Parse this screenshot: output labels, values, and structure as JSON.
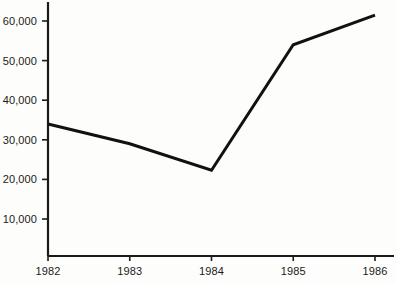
{
  "chart_data": {
    "type": "line",
    "title": "",
    "subtitle": "",
    "xlabel": "",
    "ylabel": "",
    "categories": [
      "1982",
      "1983",
      "1984",
      "1985",
      "1986"
    ],
    "x": [
      1982,
      1983,
      1984,
      1985,
      1986
    ],
    "values": [
      34000,
      29000,
      22300,
      54000,
      61500
    ],
    "series": [
      {
        "name": "",
        "values": [
          34000,
          29000,
          22300,
          54000,
          61500
        ]
      }
    ],
    "xlim": [
      1982,
      1986
    ],
    "ylim": [
      0,
      63500
    ],
    "yticks": [
      10000,
      20000,
      30000,
      40000,
      50000,
      60000
    ],
    "ytick_labels": [
      "10,000",
      "20,000",
      "30,000",
      "40,000",
      "50,000",
      "60,000"
    ],
    "xticks": [
      1982,
      1983,
      1984,
      1985,
      1986
    ],
    "xtick_labels": [
      "1982",
      "1983",
      "1984",
      "1985",
      "1986"
    ],
    "grid": false,
    "legend": false,
    "legend_position": "none",
    "markers": false,
    "line_color": "#111111",
    "line_width": 3,
    "axis_color": "#1a1a1a",
    "background_color": "#fdfdfb",
    "annotations": []
  },
  "axes": {
    "y_axis_name": "value-axis",
    "x_axis_name": "year-axis"
  }
}
